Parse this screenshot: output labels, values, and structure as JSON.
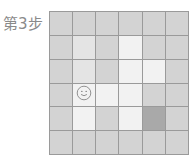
{
  "label": "第3步",
  "colors": {
    "base": "#d3d3d3",
    "light": "#e4e4e4",
    "very_light": "#f2f2f2",
    "dark": "#a9a9a9",
    "grid_line": "#9a9a9a",
    "smiley_stroke": "#7a7a7a"
  },
  "grid": {
    "rows": 6,
    "cols": 6,
    "agent": {
      "row": 3,
      "col": 1,
      "icon": "smiley-face-icon"
    },
    "cells": [
      [
        "base",
        "base",
        "base",
        "base",
        "base",
        "base"
      ],
      [
        "base",
        "light",
        "base",
        "very_light",
        "base",
        "base"
      ],
      [
        "base",
        "light",
        "base",
        "very_light",
        "very_light",
        "base"
      ],
      [
        "base",
        "very_light",
        "very_light",
        "very_light",
        "base",
        "base"
      ],
      [
        "base",
        "very_light",
        "base",
        "very_light",
        "dark",
        "base"
      ],
      [
        "base",
        "base",
        "base",
        "base",
        "base",
        "base"
      ]
    ]
  }
}
